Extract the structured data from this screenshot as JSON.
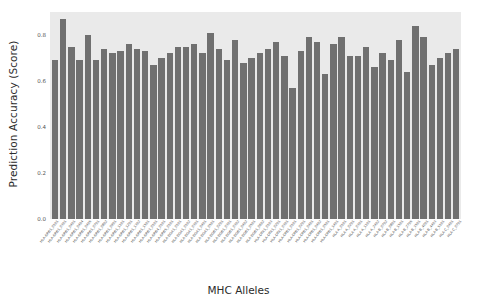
{
  "chart_data": {
    "type": "bar",
    "title": "",
    "xlabel": "MHC Alleles",
    "ylabel": "Prediction Accuracy (Score)",
    "ylim": [
      0.0,
      0.9
    ],
    "yticks": [
      "0.0",
      "0.2",
      "0.4",
      "0.6",
      "0.8"
    ],
    "ytick_values": [
      0.0,
      0.2,
      0.4,
      0.6,
      0.8
    ],
    "grid": false,
    "legend": null,
    "bar_color": "#707070",
    "plot_background": "#eaeaea",
    "figure_background": "#ffffff",
    "categories": [
      "HLA-DRB1_0101",
      "HLA-DRB1_0301",
      "HLA-DRB1_0401",
      "HLA-DRB1_0404",
      "HLA-DRB1_0405",
      "HLA-DRB1_0701",
      "HLA-DRB1_0802",
      "HLA-DRB1_0901",
      "HLA-DRB1_1101",
      "HLA-DRB1_1201",
      "HLA-DRB1_1302",
      "HLA-DRB1_1501",
      "HLA-DRB3_0101",
      "HLA-DRB4_0101",
      "HLA-DRB5_0101",
      "HLA-DQA1_0101",
      "HLA-DQA1_0102",
      "HLA-DQA1_0301",
      "HLA-DQA1_0401",
      "HLA-DQA1_0501",
      "HLA-DQB1_0201",
      "HLA-DQB1_0301",
      "HLA-DQB1_0302",
      "HLA-DQB1_0402",
      "HLA-DQB1_0501",
      "HLA-DQB1_0602",
      "HLA-DPA1_0103",
      "HLA-DPA1_0201",
      "HLA-DPA1_0301",
      "HLA-DPB1_0101",
      "HLA-DPB1_0201",
      "HLA-DPB1_0401",
      "HLA-DPB1_0402",
      "HLA-DPB1_0501",
      "HLA-DPB1_1401",
      "HLA-A_0101",
      "HLA-A_0201",
      "HLA-A_0301",
      "HLA-A_1101",
      "HLA-A_2402",
      "HLA-B_0702",
      "HLA-B_0801",
      "HLA-B_1501",
      "HLA-B_2705",
      "HLA-B_3501",
      "HLA-B_4001",
      "HLA-B_4403",
      "HLA-B_5101",
      "HLA-C_0401",
      "HLA-C_0701"
    ],
    "values": [
      0.69,
      0.87,
      0.75,
      0.69,
      0.8,
      0.69,
      0.74,
      0.72,
      0.73,
      0.76,
      0.74,
      0.73,
      0.67,
      0.7,
      0.72,
      0.75,
      0.75,
      0.76,
      0.72,
      0.81,
      0.74,
      0.69,
      0.78,
      0.68,
      0.7,
      0.72,
      0.74,
      0.77,
      0.71,
      0.57,
      0.73,
      0.79,
      0.77,
      0.63,
      0.76,
      0.79,
      0.71,
      0.71,
      0.75,
      0.66,
      0.72,
      0.69,
      0.78,
      0.64,
      0.84,
      0.79,
      0.67,
      0.7,
      0.72,
      0.74
    ]
  }
}
